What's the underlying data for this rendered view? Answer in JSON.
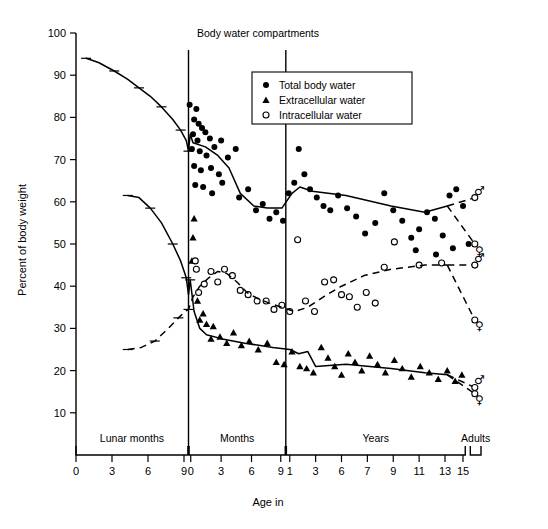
{
  "chart_data": {
    "type": "scatter",
    "title": "Body water compartments",
    "xlabel": "Age in",
    "ylabel": "Percent of body weight",
    "ylim": [
      0,
      100
    ],
    "yticks": [
      10,
      20,
      30,
      40,
      50,
      60,
      70,
      80,
      90,
      100
    ],
    "grid": false,
    "legend_position": "top-center-right",
    "legend": [
      {
        "marker": "filled-circle",
        "label": "Total body water"
      },
      {
        "marker": "filled-triangle",
        "label": "Extracellular water"
      },
      {
        "marker": "open-circle",
        "label": "Intracellular water"
      }
    ],
    "x_segments": [
      {
        "name": "Lunar months",
        "ticks": [
          "0",
          "3",
          "6",
          "9"
        ]
      },
      {
        "name": "Months",
        "ticks": [
          "0",
          "3",
          "6",
          "9"
        ]
      },
      {
        "name": "Years",
        "ticks": [
          "1",
          "3",
          "6",
          "7",
          "9",
          "11",
          "13",
          "15"
        ]
      },
      {
        "name": "Adults",
        "ticks": []
      }
    ],
    "annotations": [
      "male-symbol",
      "female-symbol"
    ],
    "series": [
      {
        "name": "Total body water",
        "marker": "filled-circle",
        "line_style": "solid",
        "trend": [
          {
            "x": 0.9,
            "y": 94.0
          },
          {
            "x": 2.0,
            "y": 93.0
          },
          {
            "x": 3.4,
            "y": 91.0
          },
          {
            "x": 4.6,
            "y": 89.0
          },
          {
            "x": 5.6,
            "y": 87.0
          },
          {
            "x": 6.6,
            "y": 85.0
          },
          {
            "x": 7.6,
            "y": 82.5
          },
          {
            "x": 8.6,
            "y": 79.5
          },
          {
            "x": 9.3,
            "y": 77.0
          },
          {
            "x": 9.8,
            "y": 74.5
          },
          {
            "x": 10.0,
            "y": 72.0
          },
          {
            "x": 10.15,
            "y": 76.0
          },
          {
            "x": 10.4,
            "y": 74.0
          },
          {
            "x": 11.5,
            "y": 73.0
          },
          {
            "x": 12.6,
            "y": 71.0
          },
          {
            "x": 13.6,
            "y": 68.0
          },
          {
            "x": 14.6,
            "y": 62.0
          },
          {
            "x": 15.8,
            "y": 59.0
          },
          {
            "x": 17.0,
            "y": 58.5
          },
          {
            "x": 18.3,
            "y": 58.5
          },
          {
            "x": 19.2,
            "y": 62.0
          },
          {
            "x": 19.9,
            "y": 63.5
          },
          {
            "x": 21.0,
            "y": 62.5
          },
          {
            "x": 24.0,
            "y": 61.5
          },
          {
            "x": 28.0,
            "y": 59.0
          },
          {
            "x": 31.0,
            "y": 57.5
          },
          {
            "x": 33.0,
            "y": 59.0
          }
        ],
        "adult_branches": [
          {
            "sex": "male",
            "y": 61.0
          },
          {
            "sex": "female",
            "y": 50.0
          }
        ],
        "points": [
          {
            "x": 10.1,
            "y": 83.0
          },
          {
            "x": 10.7,
            "y": 82.0
          },
          {
            "x": 10.5,
            "y": 79.5
          },
          {
            "x": 10.9,
            "y": 78.5
          },
          {
            "x": 11.2,
            "y": 77.5
          },
          {
            "x": 10.4,
            "y": 76.0
          },
          {
            "x": 10.8,
            "y": 74.5
          },
          {
            "x": 11.5,
            "y": 76.5
          },
          {
            "x": 11.9,
            "y": 75.0
          },
          {
            "x": 10.3,
            "y": 72.5
          },
          {
            "x": 11.0,
            "y": 72.0
          },
          {
            "x": 11.6,
            "y": 71.0
          },
          {
            "x": 12.3,
            "y": 73.0
          },
          {
            "x": 12.9,
            "y": 74.5
          },
          {
            "x": 10.5,
            "y": 68.5
          },
          {
            "x": 11.1,
            "y": 67.5
          },
          {
            "x": 12.0,
            "y": 68.0
          },
          {
            "x": 12.7,
            "y": 66.5
          },
          {
            "x": 13.5,
            "y": 70.5
          },
          {
            "x": 14.2,
            "y": 72.5
          },
          {
            "x": 10.6,
            "y": 64.0
          },
          {
            "x": 11.3,
            "y": 63.5
          },
          {
            "x": 12.1,
            "y": 62.0
          },
          {
            "x": 13.0,
            "y": 64.5
          },
          {
            "x": 14.5,
            "y": 61.0
          },
          {
            "x": 15.3,
            "y": 63.0
          },
          {
            "x": 16.0,
            "y": 58.0
          },
          {
            "x": 16.6,
            "y": 59.5
          },
          {
            "x": 17.2,
            "y": 56.0
          },
          {
            "x": 17.8,
            "y": 57.5
          },
          {
            "x": 18.4,
            "y": 55.5
          },
          {
            "x": 18.9,
            "y": 62.0
          },
          {
            "x": 19.4,
            "y": 64.5
          },
          {
            "x": 19.8,
            "y": 72.5
          },
          {
            "x": 20.3,
            "y": 66.5
          },
          {
            "x": 20.8,
            "y": 63.0
          },
          {
            "x": 21.4,
            "y": 61.0
          },
          {
            "x": 22.0,
            "y": 59.0
          },
          {
            "x": 22.6,
            "y": 58.0
          },
          {
            "x": 23.3,
            "y": 61.5
          },
          {
            "x": 24.1,
            "y": 58.5
          },
          {
            "x": 24.9,
            "y": 56.5
          },
          {
            "x": 25.7,
            "y": 52.5
          },
          {
            "x": 26.6,
            "y": 55.0
          },
          {
            "x": 27.4,
            "y": 62.0
          },
          {
            "x": 28.2,
            "y": 58.0
          },
          {
            "x": 29.0,
            "y": 55.5
          },
          {
            "x": 29.8,
            "y": 51.5
          },
          {
            "x": 30.5,
            "y": 53.5
          },
          {
            "x": 31.2,
            "y": 57.5
          },
          {
            "x": 31.9,
            "y": 56.0
          },
          {
            "x": 32.6,
            "y": 52.0
          },
          {
            "x": 33.2,
            "y": 61.5
          },
          {
            "x": 33.8,
            "y": 63.0
          },
          {
            "x": 34.4,
            "y": 59.0
          },
          {
            "x": 34.9,
            "y": 50.0
          },
          {
            "x": 32.0,
            "y": 47.5
          },
          {
            "x": 33.5,
            "y": 49.0
          },
          {
            "x": 30.2,
            "y": 48.5
          }
        ]
      },
      {
        "name": "Extracellular water",
        "marker": "filled-triangle",
        "line_style": "solid",
        "trend": [
          {
            "x": 4.6,
            "y": 61.5
          },
          {
            "x": 5.6,
            "y": 61.0
          },
          {
            "x": 6.6,
            "y": 58.5
          },
          {
            "x": 7.6,
            "y": 55.0
          },
          {
            "x": 8.6,
            "y": 50.0
          },
          {
            "x": 9.3,
            "y": 46.0
          },
          {
            "x": 9.8,
            "y": 42.0
          },
          {
            "x": 10.0,
            "y": 38.0
          },
          {
            "x": 10.15,
            "y": 41.5
          },
          {
            "x": 10.5,
            "y": 34.0
          },
          {
            "x": 11.0,
            "y": 30.0
          },
          {
            "x": 11.6,
            "y": 28.5
          },
          {
            "x": 13.0,
            "y": 27.5
          },
          {
            "x": 15.0,
            "y": 26.5
          },
          {
            "x": 17.5,
            "y": 25.5
          },
          {
            "x": 19.0,
            "y": 25.0
          },
          {
            "x": 19.8,
            "y": 24.0
          },
          {
            "x": 20.6,
            "y": 24.5
          },
          {
            "x": 21.3,
            "y": 21.0
          },
          {
            "x": 24.0,
            "y": 21.5
          },
          {
            "x": 28.0,
            "y": 20.5
          },
          {
            "x": 31.0,
            "y": 19.5
          },
          {
            "x": 33.0,
            "y": 19.0
          }
        ],
        "adult_branches": [
          {
            "sex": "male",
            "y": 16.0
          },
          {
            "sex": "female",
            "y": 14.5
          }
        ],
        "points": [
          {
            "x": 10.5,
            "y": 56.0
          },
          {
            "x": 10.4,
            "y": 51.5
          },
          {
            "x": 10.3,
            "y": 46.0
          },
          {
            "x": 10.8,
            "y": 36.5
          },
          {
            "x": 11.3,
            "y": 33.5
          },
          {
            "x": 11.0,
            "y": 32.0
          },
          {
            "x": 11.6,
            "y": 31.0
          },
          {
            "x": 12.2,
            "y": 30.5
          },
          {
            "x": 12.0,
            "y": 27.5
          },
          {
            "x": 12.8,
            "y": 28.0
          },
          {
            "x": 13.4,
            "y": 26.5
          },
          {
            "x": 14.0,
            "y": 29.0
          },
          {
            "x": 14.7,
            "y": 26.0
          },
          {
            "x": 15.4,
            "y": 27.0
          },
          {
            "x": 16.2,
            "y": 25.0
          },
          {
            "x": 17.0,
            "y": 26.5
          },
          {
            "x": 17.8,
            "y": 22.0
          },
          {
            "x": 18.5,
            "y": 21.5
          },
          {
            "x": 19.2,
            "y": 24.5
          },
          {
            "x": 19.9,
            "y": 21.0
          },
          {
            "x": 20.5,
            "y": 20.5
          },
          {
            "x": 21.1,
            "y": 19.5
          },
          {
            "x": 21.8,
            "y": 25.5
          },
          {
            "x": 22.4,
            "y": 23.0
          },
          {
            "x": 23.0,
            "y": 21.0
          },
          {
            "x": 23.6,
            "y": 19.0
          },
          {
            "x": 24.2,
            "y": 24.0
          },
          {
            "x": 24.8,
            "y": 22.0
          },
          {
            "x": 25.4,
            "y": 20.0
          },
          {
            "x": 26.1,
            "y": 23.5
          },
          {
            "x": 26.8,
            "y": 21.5
          },
          {
            "x": 27.5,
            "y": 19.5
          },
          {
            "x": 28.3,
            "y": 22.5
          },
          {
            "x": 29.0,
            "y": 20.5
          },
          {
            "x": 29.8,
            "y": 18.5
          },
          {
            "x": 30.6,
            "y": 21.0
          },
          {
            "x": 31.4,
            "y": 19.5
          },
          {
            "x": 32.2,
            "y": 18.0
          },
          {
            "x": 33.0,
            "y": 20.0
          },
          {
            "x": 33.7,
            "y": 17.5
          },
          {
            "x": 34.3,
            "y": 19.0
          }
        ]
      },
      {
        "name": "Intracellular water",
        "marker": "open-circle",
        "line_style": "dashed",
        "trend": [
          {
            "x": 4.6,
            "y": 25.0
          },
          {
            "x": 5.8,
            "y": 25.5
          },
          {
            "x": 7.0,
            "y": 27.0
          },
          {
            "x": 8.2,
            "y": 30.0
          },
          {
            "x": 9.1,
            "y": 32.5
          },
          {
            "x": 9.7,
            "y": 34.0
          },
          {
            "x": 10.0,
            "y": 34.5
          },
          {
            "x": 10.4,
            "y": 37.5
          },
          {
            "x": 11.0,
            "y": 40.0
          },
          {
            "x": 11.8,
            "y": 42.0
          },
          {
            "x": 12.6,
            "y": 43.5
          },
          {
            "x": 13.4,
            "y": 43.0
          },
          {
            "x": 14.3,
            "y": 41.0
          },
          {
            "x": 15.2,
            "y": 38.5
          },
          {
            "x": 16.2,
            "y": 37.0
          },
          {
            "x": 17.2,
            "y": 36.0
          },
          {
            "x": 18.3,
            "y": 35.0
          },
          {
            "x": 19.4,
            "y": 34.0
          },
          {
            "x": 20.6,
            "y": 35.0
          },
          {
            "x": 22.0,
            "y": 37.5
          },
          {
            "x": 23.6,
            "y": 40.0
          },
          {
            "x": 25.6,
            "y": 42.5
          },
          {
            "x": 28.0,
            "y": 44.0
          },
          {
            "x": 31.0,
            "y": 45.0
          },
          {
            "x": 33.0,
            "y": 45.0
          }
        ],
        "adult_branches": [
          {
            "sex": "male",
            "y": 45.0
          },
          {
            "sex": "female",
            "y": 32.0
          }
        ],
        "points": [
          {
            "x": 10.6,
            "y": 46.0
          },
          {
            "x": 10.7,
            "y": 44.0
          },
          {
            "x": 10.9,
            "y": 38.5
          },
          {
            "x": 11.4,
            "y": 40.5
          },
          {
            "x": 12.0,
            "y": 43.5
          },
          {
            "x": 12.6,
            "y": 41.0
          },
          {
            "x": 13.2,
            "y": 44.0
          },
          {
            "x": 13.9,
            "y": 42.5
          },
          {
            "x": 14.6,
            "y": 39.0
          },
          {
            "x": 15.3,
            "y": 38.0
          },
          {
            "x": 16.1,
            "y": 36.5
          },
          {
            "x": 16.9,
            "y": 36.5
          },
          {
            "x": 17.6,
            "y": 34.5
          },
          {
            "x": 18.3,
            "y": 35.5
          },
          {
            "x": 19.0,
            "y": 34.0
          },
          {
            "x": 19.7,
            "y": 51.0
          },
          {
            "x": 20.4,
            "y": 36.5
          },
          {
            "x": 21.2,
            "y": 34.0
          },
          {
            "x": 22.1,
            "y": 41.0
          },
          {
            "x": 22.9,
            "y": 41.5
          },
          {
            "x": 23.6,
            "y": 38.0
          },
          {
            "x": 24.3,
            "y": 37.5
          },
          {
            "x": 25.0,
            "y": 35.0
          },
          {
            "x": 25.8,
            "y": 38.5
          },
          {
            "x": 26.6,
            "y": 36.0
          },
          {
            "x": 27.4,
            "y": 44.5
          },
          {
            "x": 28.3,
            "y": 50.5
          },
          {
            "x": 30.5,
            "y": 45.0
          },
          {
            "x": 32.5,
            "y": 45.5
          }
        ]
      }
    ]
  }
}
